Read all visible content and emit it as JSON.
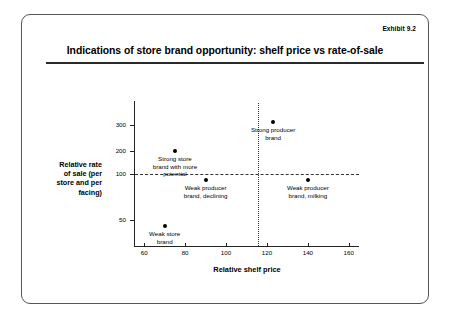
{
  "slide": {
    "exhibit_label": "Exhibit 9.2",
    "title": "Indications of store brand opportunity: shelf price vs rate-of-sale"
  },
  "chart_data": {
    "type": "scatter",
    "title": "Indications of store brand opportunity: shelf price vs rate-of-sale",
    "xlabel": "Relative shelf price",
    "ylabel": "Relative rate\nof sale (per\nstore and per\nfacing)",
    "xlim": [
      55,
      165
    ],
    "ylim": [
      25,
      330
    ],
    "grid": false,
    "legend": "none",
    "xticks": [
      60,
      80,
      100,
      120,
      140,
      160
    ],
    "xtick_labels": [
      "60",
      "80",
      "100",
      "120",
      "140",
      "160"
    ],
    "yticks": [
      300,
      200,
      100,
      50
    ],
    "ytick_labels": [
      "300",
      "200",
      "100",
      "50"
    ],
    "reference_lines": [
      {
        "axis": "y",
        "value": 100,
        "style": "dashed"
      },
      {
        "axis": "x",
        "value": 100,
        "style": "dotted"
      }
    ],
    "points": [
      {
        "label": "Strong store\nbrand with more\npotential",
        "x": 75,
        "y": 200
      },
      {
        "label": "Strong producer\nbrand",
        "x": 123,
        "y": 310
      },
      {
        "label": "Weak producer\nbrand, declining",
        "x": 90,
        "y": 93
      },
      {
        "label": "Weak producer\nbrand, milking",
        "x": 140,
        "y": 93
      },
      {
        "label": "Weak store\nbrand",
        "x": 70,
        "y": 43
      }
    ]
  }
}
